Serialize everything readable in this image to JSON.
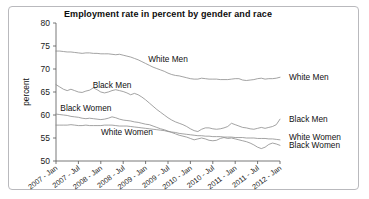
{
  "figure": {
    "frame_color": "#b9b9bd",
    "background": "#ffffff"
  },
  "chart_data": {
    "type": "line",
    "title": "Employment rate in percent by gender and race",
    "xlabel": "",
    "ylabel": "percent",
    "ylim": [
      50,
      80
    ],
    "yticks": [
      50,
      55,
      60,
      65,
      70,
      75,
      80
    ],
    "ytick_labels": [
      "50",
      "55",
      "60",
      "65",
      "70",
      "75",
      "80"
    ],
    "grid": false,
    "legend_position": "right-outside",
    "x_tick_labels": [
      "2007 - Jan",
      "2007 - Jul",
      "2008 - Jan",
      "2008 - Jul",
      "2009 - Jan",
      "2009 - Jul",
      "2010 - Jan",
      "2010 - Jul",
      "2011 - Jan",
      "2011 - Jul",
      "2012 - Jan"
    ],
    "x_tick_index": [
      0,
      6,
      12,
      18,
      24,
      30,
      36,
      42,
      48,
      54,
      60
    ],
    "x": [
      "2007-01",
      "2007-02",
      "2007-03",
      "2007-04",
      "2007-05",
      "2007-06",
      "2007-07",
      "2007-08",
      "2007-09",
      "2007-10",
      "2007-11",
      "2007-12",
      "2008-01",
      "2008-02",
      "2008-03",
      "2008-04",
      "2008-05",
      "2008-06",
      "2008-07",
      "2008-08",
      "2008-09",
      "2008-10",
      "2008-11",
      "2008-12",
      "2009-01",
      "2009-02",
      "2009-03",
      "2009-04",
      "2009-05",
      "2009-06",
      "2009-07",
      "2009-08",
      "2009-09",
      "2009-10",
      "2009-11",
      "2009-12",
      "2010-01",
      "2010-02",
      "2010-03",
      "2010-04",
      "2010-05",
      "2010-06",
      "2010-07",
      "2010-08",
      "2010-09",
      "2010-10",
      "2010-11",
      "2010-12",
      "2011-01",
      "2011-02",
      "2011-03",
      "2011-04",
      "2011-05",
      "2011-06",
      "2011-07",
      "2011-08",
      "2011-09",
      "2011-10",
      "2011-11",
      "2011-12",
      "2012-01"
    ],
    "series": [
      {
        "name": "White Men",
        "label_inside": "White Men",
        "label_right": "White Men",
        "values": [
          73.9,
          73.9,
          73.8,
          73.7,
          73.7,
          73.6,
          73.5,
          73.4,
          73.5,
          73.5,
          73.4,
          73.4,
          73.3,
          73.3,
          73.3,
          73.2,
          73.1,
          73.2,
          73.0,
          72.8,
          72.6,
          72.3,
          72.0,
          71.6,
          71.2,
          70.8,
          70.4,
          70.1,
          69.8,
          69.5,
          69.1,
          68.8,
          68.6,
          68.5,
          68.3,
          68.1,
          67.9,
          67.8,
          67.8,
          68.0,
          67.9,
          67.8,
          67.8,
          67.8,
          67.7,
          67.7,
          67.7,
          67.8,
          67.9,
          67.9,
          67.6,
          67.5,
          67.6,
          67.7,
          67.9,
          68.0,
          67.8,
          67.9,
          67.9,
          68.0,
          68.2
        ]
      },
      {
        "name": "Black Men",
        "label_inside": "Black Men",
        "label_right": "Black Men",
        "values": [
          66.6,
          66.1,
          65.6,
          65.3,
          65.6,
          65.3,
          65.0,
          64.9,
          65.2,
          65.4,
          65.9,
          65.5,
          65.0,
          64.8,
          65.0,
          65.3,
          65.5,
          65.3,
          65.1,
          64.8,
          64.4,
          64.7,
          64.4,
          63.9,
          63.3,
          62.6,
          61.9,
          61.2,
          60.6,
          60.0,
          59.4,
          58.9,
          58.5,
          58.2,
          57.9,
          57.5,
          57.0,
          56.6,
          56.4,
          56.9,
          57.2,
          57.2,
          57.0,
          56.9,
          57.0,
          57.2,
          57.5,
          58.2,
          57.9,
          57.6,
          57.3,
          57.2,
          57.0,
          56.9,
          57.1,
          57.3,
          57.1,
          57.3,
          57.5,
          57.9,
          59.1
        ]
      },
      {
        "name": "Black Women",
        "label_inside": "Black Women",
        "label_right": "Black Women",
        "values": [
          60.2,
          60.1,
          60.0,
          59.9,
          59.7,
          59.6,
          59.5,
          59.3,
          59.2,
          59.3,
          59.2,
          59.1,
          59.0,
          59.1,
          59.3,
          59.6,
          59.4,
          59.1,
          58.9,
          58.8,
          58.7,
          58.5,
          58.4,
          58.2,
          58.0,
          57.9,
          57.6,
          57.3,
          57.0,
          56.8,
          56.5,
          56.2,
          55.9,
          55.6,
          55.4,
          55.2,
          54.9,
          54.6,
          54.8,
          55.0,
          54.8,
          54.5,
          54.4,
          54.5,
          54.9,
          55.1,
          54.9,
          55.0,
          54.8,
          54.6,
          54.4,
          54.2,
          53.9,
          53.5,
          53.0,
          52.7,
          53.0,
          53.6,
          53.9,
          53.7,
          53.4
        ]
      },
      {
        "name": "White Women",
        "label_inside": "White Women",
        "label_right": "White Women",
        "values": [
          57.8,
          57.8,
          57.8,
          57.8,
          57.9,
          57.8,
          57.7,
          57.7,
          57.8,
          57.7,
          57.7,
          57.7,
          57.7,
          57.8,
          57.8,
          57.8,
          57.7,
          57.6,
          57.6,
          57.6,
          57.5,
          57.4,
          57.3,
          57.2,
          57.1,
          57.0,
          56.9,
          56.8,
          56.7,
          56.6,
          56.4,
          56.3,
          56.2,
          56.0,
          55.9,
          55.8,
          55.7,
          55.6,
          55.5,
          55.5,
          55.4,
          55.4,
          55.3,
          55.3,
          55.3,
          55.2,
          55.2,
          55.2,
          55.1,
          55.1,
          55.1,
          55.0,
          55.0,
          55.0,
          54.9,
          54.9,
          54.9,
          54.8,
          54.8,
          54.7,
          54.6
        ]
      }
    ],
    "inside_annotations": [
      {
        "text": "White Men",
        "x_index": 30,
        "y_value": 71.6
      },
      {
        "text": "Black Men",
        "x_index": 15,
        "y_value": 65.9
      },
      {
        "text": "Black Women",
        "x_index": 8,
        "y_value": 60.9
      },
      {
        "text": "White Women",
        "x_index": 19,
        "y_value": 55.6
      }
    ],
    "right_annotations": [
      {
        "text": "White Men",
        "y_value": 68.2
      },
      {
        "text": "Black Men",
        "y_value": 59.1
      },
      {
        "text": "White Women",
        "y_value": 55.3
      },
      {
        "text": "Black Women",
        "y_value": 53.4
      }
    ]
  }
}
